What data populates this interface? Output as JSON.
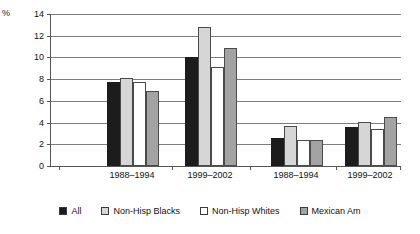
{
  "chart_data": {
    "type": "bar",
    "title": "",
    "xlabel": "",
    "ylabel": "%",
    "ylim": [
      0,
      14
    ],
    "ytick_step": 2,
    "yticks": [
      14,
      12,
      10,
      8,
      6,
      4,
      2,
      0
    ],
    "grid": true,
    "legend_position": "bottom",
    "panels": 2,
    "categories": [
      "1988–1994",
      "1999–2002",
      "1988–1994",
      "1999–2002"
    ],
    "series": [
      {
        "name": "All",
        "color": "#1c1c1c",
        "values": [
          7.7,
          10.0,
          2.6,
          3.6
        ]
      },
      {
        "name": "Non-Hisp Blacks",
        "color": "#d6d6d6",
        "values": [
          8.1,
          12.8,
          3.7,
          4.1
        ]
      },
      {
        "name": "Non-Hisp Whites",
        "color": "#ffffff",
        "values": [
          7.7,
          9.1,
          2.4,
          3.4
        ]
      },
      {
        "name": "Mexican Am",
        "color": "#a3a3a3",
        "values": [
          6.9,
          10.9,
          2.4,
          4.5
        ]
      }
    ]
  },
  "axis": {
    "unit_label": "%"
  },
  "legend": {
    "items": [
      {
        "label": "All"
      },
      {
        "label": "Non-Hisp Blacks"
      },
      {
        "label": "Non-Hisp Whites"
      },
      {
        "label": "Mexican Am"
      }
    ]
  }
}
